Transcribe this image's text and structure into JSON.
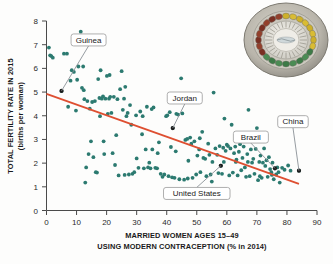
{
  "figure": {
    "background_color": "#fdfdfc",
    "point_color": "#2c7a70",
    "trendline_color": "#de4f31",
    "highlight_point_color": "#1b1b1b",
    "callout_border_color": "#9a9a9a",
    "callout_fill_color": "#ffffff",
    "axis_color": "#4a4a4a"
  },
  "decoration": {
    "pill_pack": {
      "name": "birth-control-pill-pack",
      "outer_ring_color": "#b9b5ab",
      "rim_color": "#8d8a82",
      "inner_disc_color": "#e9e7e0",
      "pill_colors": [
        "#cdb02a",
        "#d9bc33",
        "#3d7a47",
        "#4b8c54",
        "#7a2f22",
        "#93402c"
      ]
    }
  },
  "chart_data": {
    "type": "scatter",
    "title": "",
    "xlabel": "MARRIED WOMEN AGES 15–49 USING MODERN CONTRACEPTION (% in 2014)",
    "xlabel_line1": "MARRIED WOMEN AGES 15–49",
    "xlabel_line2": "USING MODERN CONTRACEPTION (% in 2014)",
    "ylabel": "TOTAL FERTILITY RATE IN 2015 (births per woman)",
    "ylabel_line1": "TOTAL FERTILITY RATE IN 2015",
    "ylabel_line2": "(births per woman)",
    "xlim": [
      0,
      90
    ],
    "ylim": [
      0,
      8
    ],
    "xticks": [
      0,
      10,
      20,
      30,
      40,
      50,
      60,
      70,
      80,
      90
    ],
    "yticks": [
      0,
      1,
      2,
      3,
      4,
      5,
      6,
      7,
      8
    ],
    "grid": false,
    "legend": null,
    "trendline": {
      "type": "linear-fit",
      "x_start": 0,
      "y_start": 4.92,
      "x_end": 84,
      "y_end": 1.12
    },
    "annotations": [
      {
        "label": "Guinea",
        "x": 5,
        "y": 5.05,
        "box_x": 14,
        "box_y": 7.2
      },
      {
        "label": "Jordan",
        "x": 42,
        "y": 3.48,
        "box_x": 46,
        "box_y": 4.75
      },
      {
        "label": "United States",
        "x": 58,
        "y": 1.89,
        "box_x": 50,
        "box_y": 0.72
      },
      {
        "label": "Brazil",
        "x": 76,
        "y": 1.78,
        "box_x": 68,
        "box_y": 3.1
      },
      {
        "label": "China",
        "x": 84,
        "y": 1.68,
        "box_x": 82,
        "box_y": 3.75
      }
    ],
    "points": [
      [
        0.8,
        6.88
      ],
      [
        1.2,
        6.55
      ],
      [
        1.6,
        6.52
      ],
      [
        2.1,
        6.45
      ],
      [
        5.0,
        5.05
      ],
      [
        6.8,
        6.62
      ],
      [
        7.2,
        4.38
      ],
      [
        8.4,
        5.92
      ],
      [
        9.1,
        5.85
      ],
      [
        9.8,
        4.22
      ],
      [
        10.2,
        5.52
      ],
      [
        10.6,
        6.08
      ],
      [
        11.4,
        7.55
      ],
      [
        11.8,
        5.18
      ],
      [
        12.2,
        6.08
      ],
      [
        12.6,
        4.7
      ],
      [
        12.9,
        1.18
      ],
      [
        13.2,
        1.82
      ],
      [
        13.6,
        4.62
      ],
      [
        14.0,
        2.38
      ],
      [
        14.4,
        4.3
      ],
      [
        14.8,
        2.92
      ],
      [
        15.2,
        4.58
      ],
      [
        15.6,
        2.25
      ],
      [
        16.1,
        4.62
      ],
      [
        16.4,
        1.62
      ],
      [
        16.8,
        1.6
      ],
      [
        17.2,
        5.55
      ],
      [
        17.6,
        4.75
      ],
      [
        18.0,
        5.92
      ],
      [
        18.4,
        4.72
      ],
      [
        18.8,
        4.82
      ],
      [
        19.2,
        2.38
      ],
      [
        19.6,
        4.72
      ],
      [
        20.1,
        5.68
      ],
      [
        20.4,
        4.08
      ],
      [
        20.8,
        4.72
      ],
      [
        21.2,
        4.8
      ],
      [
        21.6,
        4.12
      ],
      [
        22.0,
        2.42
      ],
      [
        22.4,
        4.8
      ],
      [
        22.8,
        1.92
      ],
      [
        23.2,
        3.18
      ],
      [
        23.6,
        4.7
      ],
      [
        24.0,
        1.48
      ],
      [
        24.5,
        5.12
      ],
      [
        25.0,
        5.88
      ],
      [
        25.4,
        4.25
      ],
      [
        25.8,
        4.72
      ],
      [
        26.2,
        5.22
      ],
      [
        26.6,
        3.98
      ],
      [
        27.0,
        4.12
      ],
      [
        27.4,
        1.52
      ],
      [
        27.8,
        4.45
      ],
      [
        28.2,
        3.62
      ],
      [
        28.6,
        1.55
      ],
      [
        29.2,
        1.62
      ],
      [
        30.0,
        2.2
      ],
      [
        30.6,
        1.8
      ],
      [
        31.2,
        4.18
      ],
      [
        31.8,
        3.22
      ],
      [
        32.4,
        1.78
      ],
      [
        33.0,
        2.58
      ],
      [
        33.4,
        4.38
      ],
      [
        33.8,
        1.82
      ],
      [
        34.2,
        2.02
      ],
      [
        34.6,
        1.78
      ],
      [
        35.0,
        4.28
      ],
      [
        35.6,
        4.35
      ],
      [
        36.2,
        1.8
      ],
      [
        36.8,
        1.78
      ],
      [
        37.4,
        2.88
      ],
      [
        38.0,
        1.55
      ],
      [
        38.6,
        1.42
      ],
      [
        39.2,
        1.52
      ],
      [
        39.8,
        3.98
      ],
      [
        40.2,
        4.02
      ],
      [
        40.6,
        1.45
      ],
      [
        41.0,
        4.15
      ],
      [
        41.4,
        2.68
      ],
      [
        41.8,
        1.4
      ],
      [
        42.0,
        3.48
      ],
      [
        42.6,
        1.38
      ],
      [
        43.2,
        4.08
      ],
      [
        43.8,
        4.05
      ],
      [
        44.2,
        1.32
      ],
      [
        44.8,
        5.58
      ],
      [
        45.2,
        4.1
      ],
      [
        45.8,
        1.3
      ],
      [
        46.2,
        2.98
      ],
      [
        46.8,
        3.02
      ],
      [
        47.2,
        2.1
      ],
      [
        47.8,
        3.08
      ],
      [
        48.2,
        2.82
      ],
      [
        48.6,
        1.38
      ],
      [
        49.2,
        2.92
      ],
      [
        49.8,
        1.52
      ],
      [
        50.2,
        2.32
      ],
      [
        50.8,
        2.58
      ],
      [
        51.2,
        1.62
      ],
      [
        51.8,
        3.32
      ],
      [
        52.2,
        2.22
      ],
      [
        52.8,
        2.18
      ],
      [
        53.2,
        1.45
      ],
      [
        53.8,
        2.82
      ],
      [
        54.2,
        2.35
      ],
      [
        54.6,
        1.52
      ],
      [
        55.0,
        1.22
      ],
      [
        55.6,
        4.98
      ],
      [
        56.2,
        2.62
      ],
      [
        56.8,
        2.35
      ],
      [
        57.2,
        1.58
      ],
      [
        57.6,
        2.72
      ],
      [
        58.0,
        1.89
      ],
      [
        58.4,
        1.55
      ],
      [
        58.8,
        2.65
      ],
      [
        59.2,
        3.88
      ],
      [
        59.6,
        2.52
      ],
      [
        60.0,
        2.78
      ],
      [
        60.4,
        2.72
      ],
      [
        60.8,
        1.48
      ],
      [
        61.2,
        2.62
      ],
      [
        61.6,
        3.62
      ],
      [
        62.0,
        1.6
      ],
      [
        62.4,
        2.42
      ],
      [
        62.8,
        2.7
      ],
      [
        63.2,
        2.15
      ],
      [
        63.6,
        1.48
      ],
      [
        64.0,
        2.48
      ],
      [
        64.4,
        2.8
      ],
      [
        64.8,
        1.7
      ],
      [
        65.2,
        2.22
      ],
      [
        65.6,
        2.7
      ],
      [
        66.0,
        1.82
      ],
      [
        66.4,
        1.42
      ],
      [
        66.8,
        2.38
      ],
      [
        67.2,
        4.25
      ],
      [
        67.6,
        1.45
      ],
      [
        68.0,
        2.58
      ],
      [
        68.4,
        2.02
      ],
      [
        68.8,
        2.18
      ],
      [
        69.2,
        1.55
      ],
      [
        69.6,
        2.6
      ],
      [
        70.0,
        3.48
      ],
      [
        70.4,
        1.28
      ],
      [
        70.8,
        2.05
      ],
      [
        71.2,
        2.32
      ],
      [
        71.6,
        1.38
      ],
      [
        72.0,
        2.02
      ],
      [
        72.4,
        2.62
      ],
      [
        72.8,
        1.88
      ],
      [
        73.2,
        2.12
      ],
      [
        73.6,
        1.42
      ],
      [
        74.0,
        2.25
      ],
      [
        74.4,
        1.75
      ],
      [
        74.8,
        1.62
      ],
      [
        75.2,
        2.02
      ],
      [
        75.6,
        1.32
      ],
      [
        76.0,
        1.78
      ],
      [
        76.4,
        1.52
      ],
      [
        76.8,
        1.82
      ],
      [
        77.2,
        1.62
      ],
      [
        77.6,
        1.18
      ],
      [
        78.4,
        1.8
      ],
      [
        79.2,
        1.72
      ],
      [
        80.4,
        1.9
      ],
      [
        81.2,
        1.68
      ],
      [
        84.0,
        1.68
      ],
      [
        5.8,
        6.62
      ],
      [
        8.0,
        5.48
      ],
      [
        12.4,
        5.08
      ],
      [
        17.8,
        3.98
      ],
      [
        19.0,
        2.92
      ],
      [
        21.0,
        5.72
      ],
      [
        26.0,
        1.5
      ],
      [
        29.8,
        4.02
      ],
      [
        32.0,
        3.98
      ],
      [
        35.2,
        2.58
      ],
      [
        37.0,
        2.42
      ],
      [
        43.0,
        2.5
      ],
      [
        47.0,
        1.35
      ],
      [
        51.0,
        3.05
      ],
      [
        55.2,
        2.05
      ],
      [
        59.0,
        2.05
      ],
      [
        63.0,
        2.05
      ],
      [
        67.0,
        2.05
      ],
      [
        71.0,
        1.45
      ],
      [
        75.0,
        1.5
      ]
    ]
  }
}
